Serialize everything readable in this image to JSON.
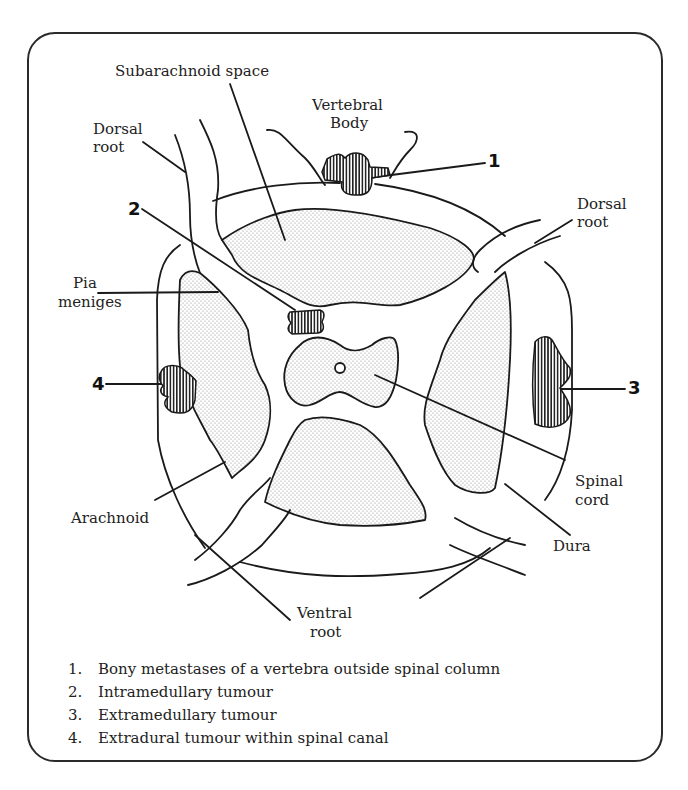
{
  "figure": {
    "labels": {
      "subarachnoid_space": "Subarachnoid space",
      "vertebral_body_line1": "Vertebral",
      "vertebral_body_line2": "Body",
      "dorsal_root_left_line1": "Dorsal",
      "dorsal_root_left_line2": "root",
      "dorsal_root_right_line1": "Dorsal",
      "dorsal_root_right_line2": "root",
      "pia_line1": "Pia",
      "pia_line2": "meniges",
      "spinal_cord_line1": "Spinal",
      "spinal_cord_line2": "cord",
      "arachnoid": "Arachnoid",
      "dura": "Dura",
      "ventral_root_line1": "Ventral",
      "ventral_root_line2": "root"
    },
    "markers": [
      "1",
      "2",
      "3",
      "4"
    ],
    "legend": [
      {
        "num": "1.",
        "text": "Bony metastases of a vertebra outside spinal column"
      },
      {
        "num": "2.",
        "text": "Intramedullary tumour"
      },
      {
        "num": "3.",
        "text": "Extramedullary tumour"
      },
      {
        "num": "4.",
        "text": "Extradural tumour within spinal canal"
      }
    ],
    "colors": {
      "line": "#1a1a1a",
      "stipple": "#9a9a9a",
      "background": "#ffffff"
    }
  }
}
